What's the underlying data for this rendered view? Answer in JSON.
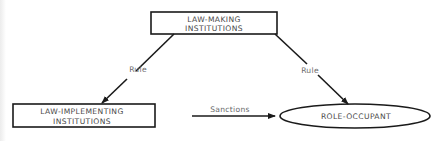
{
  "diagram": {
    "type": "flow-diagram",
    "nodes": [
      {
        "id": "law-making",
        "shape": "rectangle",
        "lines": [
          "LAW-MAKING",
          "INSTITUTIONS"
        ]
      },
      {
        "id": "law-implementing",
        "shape": "rectangle",
        "lines": [
          "LAW-IMPLEMENTING",
          "INSTITUTIONS"
        ]
      },
      {
        "id": "role-occupant",
        "shape": "ellipse",
        "lines": [
          "ROLE-OCCUPANT"
        ]
      }
    ],
    "edges": [
      {
        "from": "law-making",
        "to": "law-implementing",
        "label": "Rule"
      },
      {
        "from": "law-making",
        "to": "role-occupant",
        "label": "Rule"
      },
      {
        "from": "law-implementing",
        "to": "role-occupant",
        "label": "Sanctions"
      }
    ]
  },
  "labels": {
    "law_making_line1": "LAW-MAKING",
    "law_making_line2": "INSTITUTIONS",
    "law_implementing_line1": "LAW-IMPLEMENTING",
    "law_implementing_line2": "INSTITUTIONS",
    "role_occupant": "ROLE-OCCUPANT",
    "rule_left": "Rule",
    "rule_right": "Rule",
    "sanctions": "Sanctions"
  },
  "colors": {
    "stroke": "#1a1a1a",
    "text": "#4a4a4a",
    "background": "#ffffff"
  }
}
